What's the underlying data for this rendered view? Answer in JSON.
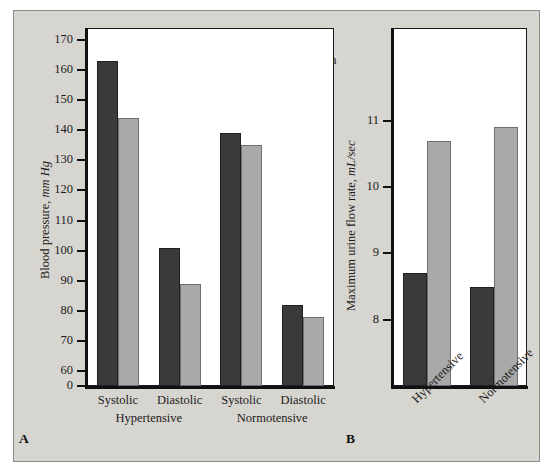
{
  "figure": {
    "background_color": "#d7d5d0",
    "plot_background_color": "#ffffff"
  },
  "legend": {
    "position": "top-center-right",
    "entries": [
      {
        "label": "Baseline",
        "color": "#3a3a3a",
        "key": "baseline"
      },
      {
        "label": "Doxazosin",
        "color": "#a9a9a9",
        "key": "doxazosin"
      }
    ]
  },
  "panels": [
    {
      "letter": "A",
      "ylabel_plain": "Blood pressure, ",
      "ylabel_italic": "mm Hg",
      "group_labels": [
        "Hypertensive",
        "Normotensive"
      ]
    },
    {
      "letter": "B",
      "ylabel_plain": "Maximum urine flow rate, ",
      "ylabel_italic": "mL/sec",
      "group_labels": [
        "Hypertensive",
        "Normotensive"
      ]
    }
  ],
  "chart_data": [
    {
      "type": "bar",
      "panel": "A",
      "title": "",
      "xlabel": "",
      "ylabel": "Blood pressure, mm Hg",
      "categories": [
        "Systolic",
        "Diastolic",
        "Systolic",
        "Diastolic"
      ],
      "group_labels": [
        "Hypertensive",
        "Normotensive"
      ],
      "series": [
        {
          "name": "Baseline",
          "color": "#3a3a3a",
          "values": [
            163,
            101,
            139,
            82
          ]
        },
        {
          "name": "Doxazosin",
          "color": "#a9a9a9",
          "values": [
            144,
            89,
            135,
            78
          ]
        }
      ],
      "ylim": [
        55,
        174
      ],
      "yticks": [
        60,
        70,
        80,
        90,
        100,
        110,
        120,
        130,
        140,
        150,
        160,
        170
      ],
      "ytick_labels": [
        "60",
        "70",
        "80",
        "90",
        "100",
        "110",
        "120",
        "130",
        "140",
        "150",
        "160",
        "170"
      ],
      "axis_break_label": "0",
      "grid": false,
      "legend_position": "top-right"
    },
    {
      "type": "bar",
      "panel": "B",
      "title": "",
      "xlabel": "",
      "ylabel": "Maximum urine flow rate, mL/sec",
      "categories": [
        "Hypertensive",
        "Normotensive"
      ],
      "series": [
        {
          "name": "Baseline",
          "color": "#3a3a3a",
          "values": [
            8.7,
            8.5
          ]
        },
        {
          "name": "Doxazosin",
          "color": "#a9a9a9",
          "values": [
            10.7,
            10.9
          ]
        }
      ],
      "ylim": [
        7.0,
        12.4
      ],
      "yticks": [
        8,
        9,
        10,
        11
      ],
      "ytick_labels": [
        "8",
        "9",
        "10",
        "11"
      ],
      "grid": false,
      "legend_position": "shared-with-panel-A"
    }
  ]
}
